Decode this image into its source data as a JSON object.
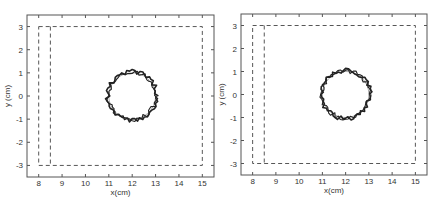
{
  "chart_data": [
    {
      "type": "line",
      "title": "",
      "xlabel": "x(cm)",
      "ylabel": "y (cm)",
      "xlim": [
        7.5,
        15.5
      ],
      "ylim": [
        -3.5,
        3.5
      ],
      "xticks": [
        8,
        9,
        10,
        11,
        12,
        13,
        14,
        15
      ],
      "yticks": [
        -3,
        -2,
        -1,
        0,
        1,
        2,
        3
      ],
      "grid": false,
      "legend": null,
      "series": [
        {
          "name": "outer boundary (dashed)",
          "style": "dashed",
          "x": [
            8,
            15,
            15,
            8,
            8
          ],
          "y": [
            3,
            3,
            -3,
            -3,
            3
          ]
        },
        {
          "name": "inner boundary (dashed)",
          "style": "dashed",
          "x": [
            8.5,
            8.5
          ],
          "y": [
            3,
            -3
          ]
        },
        {
          "name": "reference circle",
          "style": "thin",
          "center": [
            12,
            0
          ],
          "radius": 1.0
        },
        {
          "name": "estimated contour",
          "style": "thick",
          "center": [
            12,
            0
          ],
          "radius": 1.05,
          "jitter": 0.1
        }
      ]
    },
    {
      "type": "line",
      "title": "",
      "xlabel": "x(cm)",
      "ylabel": "y (cm)",
      "xlim": [
        7.5,
        15.5
      ],
      "ylim": [
        -3.5,
        3.5
      ],
      "xticks": [
        8,
        9,
        10,
        11,
        12,
        13,
        14,
        15
      ],
      "yticks": [
        -3,
        -2,
        -1,
        0,
        1,
        2,
        3
      ],
      "grid": false,
      "legend": null,
      "series": [
        {
          "name": "outer boundary (dashed)",
          "style": "dashed",
          "x": [
            8,
            15,
            15,
            8,
            8
          ],
          "y": [
            3,
            3,
            -3,
            -3,
            3
          ]
        },
        {
          "name": "inner boundary (dashed)",
          "style": "dashed",
          "x": [
            8.5,
            8.5
          ],
          "y": [
            3,
            -3
          ]
        },
        {
          "name": "reference circle",
          "style": "thin",
          "center": [
            12,
            0
          ],
          "radius": 1.0
        },
        {
          "name": "estimated contour",
          "style": "thick",
          "center": [
            12,
            0
          ],
          "radius": 1.05,
          "jitter": 0.1
        }
      ]
    }
  ],
  "panels": [
    {
      "box": {
        "left": 27,
        "top": 15,
        "right": 214,
        "bottom": 177
      }
    },
    {
      "box": {
        "left": 241,
        "top": 14,
        "right": 427,
        "bottom": 175
      }
    }
  ],
  "colors": {
    "axis": "#555555",
    "dash": "#444444",
    "contour": "#222222",
    "reference": "#888888"
  }
}
